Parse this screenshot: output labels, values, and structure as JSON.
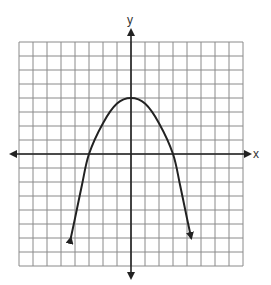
{
  "chart_data": {
    "type": "line",
    "title": "",
    "xlabel": "x",
    "ylabel": "y",
    "xlim": [
      -8,
      8
    ],
    "ylim": [
      -8,
      8
    ],
    "grid": true,
    "grid_step": 1,
    "legend": null,
    "series": [
      {
        "name": "parabola",
        "description": "Downward-opening parabola with arrows on both ends",
        "vertex": [
          0,
          4
        ],
        "x_intercepts": [
          -3,
          3
        ],
        "y_intercept": 4,
        "endpoints_with_arrows": [
          [
            -4.3,
            -6
          ],
          [
            4.3,
            -6
          ]
        ],
        "points": [
          [
            -4.3,
            -6
          ],
          [
            -4,
            -4.6
          ],
          [
            -3.5,
            -2.2
          ],
          [
            -3,
            0
          ],
          [
            -2,
            2.2
          ],
          [
            -1,
            3.6
          ],
          [
            0,
            4
          ],
          [
            1,
            3.6
          ],
          [
            2,
            2.2
          ],
          [
            3,
            0
          ],
          [
            3.5,
            -2.2
          ],
          [
            4,
            -4.6
          ],
          [
            4.3,
            -6
          ]
        ]
      }
    ]
  },
  "labels": {
    "x_axis": "x",
    "y_axis": "y"
  },
  "colors": {
    "grid": "#8a8a8a",
    "axis": "#222222",
    "curve": "#222222",
    "background": "#ffffff"
  }
}
